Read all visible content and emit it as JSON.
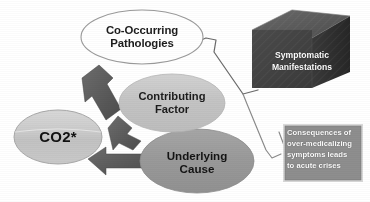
{
  "diagram": {
    "title_visible": false,
    "background_color": "#ffffff",
    "nodes": [
      {
        "id": "co-occurring-pathologies",
        "label": "Co-Occurring\nPathologies",
        "shape": "ellipse",
        "fill": "#ffffff",
        "stroke": "#9a9a9a",
        "text_color": "#1c1c1c"
      },
      {
        "id": "contributing-factor",
        "label": "Contributing\nFactor",
        "shape": "ellipse",
        "fill": "#c6c6c6",
        "stroke": "#c6c6c6",
        "text_color": "#1c1c1c"
      },
      {
        "id": "underlying-cause",
        "label": "Underlying\nCause",
        "shape": "ellipse",
        "fill": "#9b9b9b",
        "stroke": "#9b9b9b",
        "text_color": "#141414"
      },
      {
        "id": "co2",
        "label": "CO2*",
        "shape": "ellipse",
        "fill": "#c9c9c9",
        "stroke": "#a8a8a8",
        "text_color": "#111111"
      },
      {
        "id": "symptomatic-manifestations",
        "label": "Symptomatic\nManifestations",
        "shape": "cube",
        "fill": "#454545",
        "top_face_fill": "#5e5e5e",
        "side_face_fill": "#2f2f2f",
        "text_color": "#ffffff"
      },
      {
        "id": "consequences-box",
        "label": "Consequences of\nover-medicalizing\nsymptoms leads\nto acute crises",
        "shape": "rectangle",
        "fill": "#8e8e8e",
        "stroke": "#d6d6d6",
        "text_color": "#ffffff"
      }
    ],
    "arrows": [
      {
        "id": "arrow-pathologies-to-co2",
        "from": "co-occurring-pathologies",
        "to": "co2",
        "style": "block-arrow",
        "color": "#555555"
      },
      {
        "id": "arrow-contributing-to-co2",
        "from": "contributing-factor",
        "to": "co2",
        "style": "block-arrow",
        "color": "#6a6a6a"
      },
      {
        "id": "arrow-underlying-to-co2",
        "from": "underlying-cause",
        "to": "co2",
        "style": "block-arrow",
        "color": "#585858"
      }
    ],
    "connectors": [
      {
        "id": "bracket-to-symptomatic-manifestations",
        "from": "co-occurring-pathologies",
        "to": "symptomatic-manifestations",
        "style": "thin-bracket",
        "color": "#6b6b6b"
      },
      {
        "id": "bracket-to-consequences",
        "from": "underlying-cause",
        "to": "consequences-box",
        "style": "thin-bracket",
        "color": "#8a8a8a"
      }
    ]
  }
}
